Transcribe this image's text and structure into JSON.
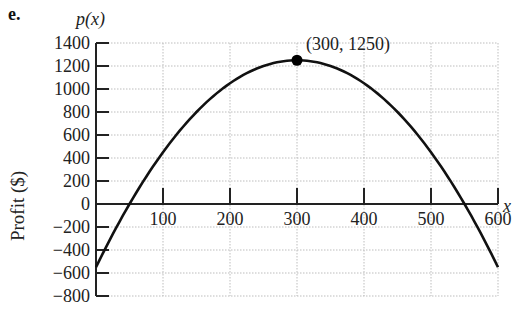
{
  "part_label": "e.",
  "chart_data": {
    "type": "line",
    "title": "",
    "function_label": "p(x)",
    "xlabel": "x",
    "ylabel": "Profit ($)",
    "xlim": [
      0,
      600
    ],
    "ylim": [
      -800,
      1400
    ],
    "x_ticks": [
      100,
      200,
      300,
      400,
      500,
      600
    ],
    "x_tick_labels": [
      "100",
      "200",
      "300",
      "400",
      "500",
      "600"
    ],
    "y_ticks": [
      1400,
      1200,
      1000,
      800,
      600,
      400,
      200,
      0,
      -200,
      -400,
      -600,
      -800
    ],
    "y_tick_labels": [
      "1400",
      "1200",
      "1000",
      "800",
      "600",
      "400",
      "200",
      "0",
      "−200",
      "−400",
      "−600",
      "−800"
    ],
    "grid": true,
    "series": [
      {
        "name": "p(x)",
        "equation": "p(x) = -0.02(x - 300)^2 + 1250",
        "x": [
          0,
          50,
          100,
          150,
          200,
          250,
          300,
          350,
          400,
          450,
          500,
          550,
          600
        ],
        "values": [
          -550,
          0,
          450,
          800,
          1050,
          1200,
          1250,
          1200,
          1050,
          800,
          450,
          0,
          -550
        ]
      }
    ],
    "annotations": [
      {
        "label": "(300, 1250)",
        "x": 300,
        "y": 1250,
        "marker": "filled-circle"
      }
    ],
    "colors": {
      "curve": "#111111",
      "grid": "#bdbdbd",
      "axis": "#222222"
    }
  }
}
